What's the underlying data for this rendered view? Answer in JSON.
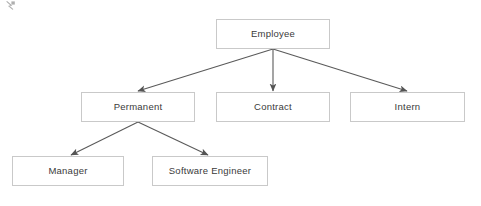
{
  "diagram": {
    "type": "class-hierarchy-tree",
    "background_color": "#ffffff",
    "box_border_color": "#c9c9c9",
    "box_fill_color": "#ffffff",
    "edge_color": "#5a5a5a",
    "text_color": "#3a3a3a",
    "nodes": [
      {
        "id": "employee",
        "label": "Employee",
        "x": 216,
        "y": 19,
        "w": 114,
        "h": 30,
        "level": 0
      },
      {
        "id": "permanent",
        "label": "Permanent",
        "x": 81,
        "y": 92,
        "w": 114,
        "h": 30,
        "level": 1
      },
      {
        "id": "contract",
        "label": "Contract",
        "x": 216,
        "y": 92,
        "w": 114,
        "h": 30,
        "level": 1
      },
      {
        "id": "intern",
        "label": "Intern",
        "x": 350,
        "y": 92,
        "w": 115,
        "h": 30,
        "level": 1
      },
      {
        "id": "manager",
        "label": "Manager",
        "x": 12,
        "y": 156,
        "w": 112,
        "h": 30,
        "level": 2
      },
      {
        "id": "software-engineer",
        "label": "Software Engineer",
        "x": 152,
        "y": 156,
        "w": 116,
        "h": 30,
        "level": 2
      }
    ],
    "edges": [
      {
        "id": "employee-to-permanent",
        "from": "employee",
        "to": "permanent",
        "x1": 273,
        "y1": 49,
        "x2": 138,
        "y2": 91
      },
      {
        "id": "employee-to-contract",
        "from": "employee",
        "to": "contract",
        "x1": 273,
        "y1": 49,
        "x2": 273,
        "y2": 91
      },
      {
        "id": "employee-to-intern",
        "from": "employee",
        "to": "intern",
        "x1": 273,
        "y1": 49,
        "x2": 407,
        "y2": 91
      },
      {
        "id": "permanent-to-manager",
        "from": "permanent",
        "to": "manager",
        "x1": 138,
        "y1": 122,
        "x2": 71,
        "y2": 155
      },
      {
        "id": "permanent-to-software-engineer",
        "from": "permanent",
        "to": "software-engineer",
        "x1": 138,
        "y1": 122,
        "x2": 208,
        "y2": 155
      }
    ]
  }
}
